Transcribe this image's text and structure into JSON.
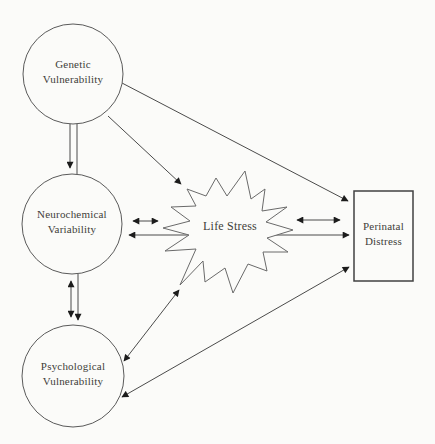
{
  "diagram": {
    "type": "path-model",
    "nodes": {
      "genetic": {
        "label": "Genetic Vulnerability",
        "shape": "circle"
      },
      "neurochemical": {
        "label": "Neurochemical Variability",
        "shape": "circle"
      },
      "psychological": {
        "label": "Psychological Vulnerability",
        "shape": "circle"
      },
      "life_stress": {
        "label": "Life Stress",
        "shape": "starburst"
      },
      "perinatal": {
        "label": "Perinatal Distress",
        "shape": "rectangle"
      }
    },
    "edges": [
      {
        "from": "Genetic Vulnerability",
        "to": "Neurochemical Variability",
        "style": "downward arrow with parallel plain line"
      },
      {
        "from": "Neurochemical Variability",
        "to": "Psychological Vulnerability",
        "style": "bidirectional arrow with parallel downward arrow"
      },
      {
        "from": "Genetic Vulnerability",
        "to": "Life Stress",
        "style": "arrow"
      },
      {
        "from": "Genetic Vulnerability",
        "to": "Perinatal Distress",
        "style": "arrow"
      },
      {
        "from": "Neurochemical Variability",
        "to": "Life Stress",
        "style": "bidirectional arrow"
      },
      {
        "from": "Neurochemical Variability",
        "to": "Perinatal Distress",
        "style": "bidirectional arrow passing behind Life Stress"
      },
      {
        "from": "Life Stress",
        "to": "Perinatal Distress",
        "style": "bidirectional arrow"
      },
      {
        "from": "Psychological Vulnerability",
        "to": "Life Stress",
        "style": "bidirectional arrow"
      },
      {
        "from": "Psychological Vulnerability",
        "to": "Perinatal Distress",
        "style": "bidirectional arrow"
      }
    ],
    "colors": {
      "background": "#fbfbf9",
      "line": "#4b4b4b",
      "shape_stroke": "#5a5a5a",
      "arrowhead": "#1c1c1c",
      "text": "#3f3e39"
    }
  }
}
